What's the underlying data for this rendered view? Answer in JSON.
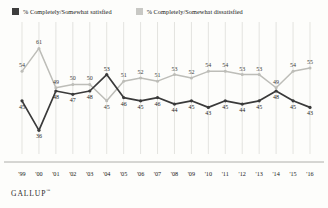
{
  "legend": {
    "satisfied": {
      "label": "% Completely/Somewhat satisfied",
      "color": "#3d3d3d",
      "swatch": "square-swatch-satisfied"
    },
    "dissatisfied": {
      "label": "% Completely/Somewhat dissatisfied",
      "color": "#c8c8c4",
      "swatch": "square-swatch-dissatisfied"
    }
  },
  "footer": {
    "brand": "GALLUP",
    "trademark": "™"
  },
  "chart_data": {
    "type": "line",
    "title": "",
    "subtitle": "",
    "xlabel": "",
    "ylabel": "",
    "ylim": [
      30,
      66
    ],
    "grid": true,
    "legend_position": "top-left",
    "categories": [
      "'99",
      "'00",
      "'01",
      "'02",
      "'03",
      "'04",
      "'05",
      "'06",
      "'07",
      "'08",
      "'09",
      "'10",
      "'11",
      "'12",
      "'13",
      "'14",
      "'15",
      "'16"
    ],
    "series": [
      {
        "name": "% Completely/Somewhat satisfied",
        "color": "#3d3d3d",
        "values": [
          45,
          36,
          48,
          47,
          48,
          53,
          46,
          45,
          46,
          44,
          45,
          43,
          45,
          44,
          45,
          48,
          45,
          43
        ]
      },
      {
        "name": "% Completely/Somewhat dissatisfied",
        "color": "#c8c8c4",
        "values": [
          54,
          61,
          49,
          50,
          50,
          45,
          51,
          52,
          51,
          53,
          52,
          54,
          54,
          53,
          53,
          49,
          54,
          55
        ]
      }
    ]
  }
}
